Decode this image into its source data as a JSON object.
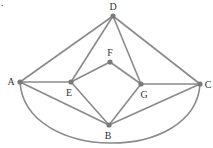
{
  "figure_marker": ".",
  "graph": {
    "nodes": [
      {
        "id": "D",
        "label": "D"
      },
      {
        "id": "A",
        "label": "A"
      },
      {
        "id": "E",
        "label": "E"
      },
      {
        "id": "F",
        "label": "F"
      },
      {
        "id": "G",
        "label": "G"
      },
      {
        "id": "C",
        "label": "C"
      },
      {
        "id": "B",
        "label": "B"
      }
    ],
    "edges": [
      [
        "A",
        "D"
      ],
      [
        "D",
        "E"
      ],
      [
        "D",
        "G"
      ],
      [
        "D",
        "C"
      ],
      [
        "A",
        "E"
      ],
      [
        "E",
        "F"
      ],
      [
        "F",
        "G"
      ],
      [
        "G",
        "C"
      ],
      [
        "A",
        "B"
      ],
      [
        "E",
        "B"
      ],
      [
        "G",
        "B"
      ],
      [
        "C",
        "B"
      ],
      [
        "A",
        "C"
      ]
    ],
    "curved_edges": [
      [
        "A",
        "C"
      ]
    ]
  }
}
